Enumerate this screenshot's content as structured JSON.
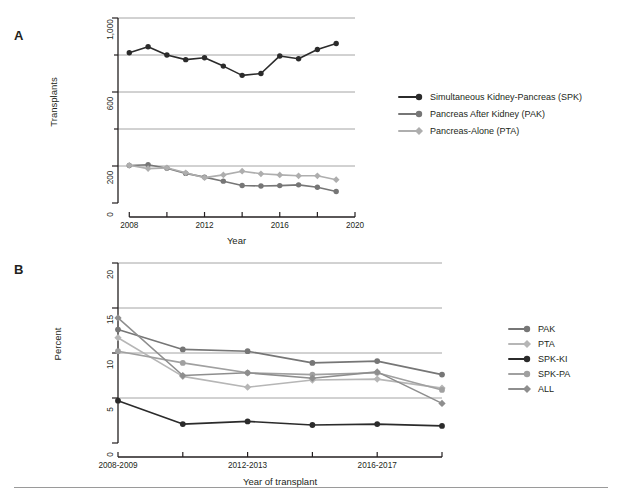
{
  "figure": {
    "panels": [
      {
        "letter": "A"
      },
      {
        "letter": "B"
      }
    ]
  },
  "chart_data": [
    {
      "type": "line",
      "panel": "A",
      "title": "",
      "xlabel": "Year",
      "ylabel": "Transplants",
      "xlim": [
        2007.4,
        2020.0
      ],
      "ylim": [
        0,
        1000
      ],
      "xticks": [
        2008,
        2010,
        2012,
        2014,
        2016,
        2018,
        2020
      ],
      "xticklabels": [
        "2008",
        "",
        "2012",
        "",
        "2016",
        "",
        "2020"
      ],
      "yticks": [
        0,
        200,
        400,
        600,
        800,
        1000
      ],
      "yticklabels": [
        "0",
        "200",
        "",
        "600",
        "",
        "1,000"
      ],
      "gridlines": [
        200,
        400,
        600,
        800,
        1000
      ],
      "grid": true,
      "legend_position": "right",
      "x": [
        2008,
        2009,
        2010,
        2011,
        2012,
        2013,
        2014,
        2015,
        2016,
        2017,
        2018,
        2019
      ],
      "series": [
        {
          "name": "Simultaneous Kidney-Pancreas (SPK)",
          "key": "SPK",
          "color": "#2b2b2b",
          "marker": "circle",
          "values": [
            812,
            845,
            800,
            775,
            785,
            740,
            690,
            700,
            795,
            780,
            830,
            862
          ]
        },
        {
          "name": "Pancreas After Kidney (PAK)",
          "key": "PAK",
          "color": "#767676",
          "marker": "circle",
          "values": [
            203,
            207,
            188,
            160,
            140,
            118,
            95,
            92,
            94,
            98,
            85,
            62
          ]
        },
        {
          "name": "Pancreas-Alone (PTA)",
          "key": "PTA",
          "color": "#aeaeae",
          "marker": "diamond",
          "values": [
            204,
            186,
            190,
            163,
            137,
            152,
            172,
            158,
            152,
            147,
            147,
            126
          ]
        }
      ]
    },
    {
      "type": "line",
      "panel": "B",
      "title": "",
      "xlabel": "Year of transplant",
      "ylabel": "Percent",
      "xlim": [
        0,
        5
      ],
      "ylim": [
        0,
        20
      ],
      "xticks": [
        0,
        1,
        2,
        3,
        4,
        5
      ],
      "xticklabels": [
        "2008-2009",
        "",
        "2012-2013",
        "",
        "2016-2017",
        ""
      ],
      "categories": [
        "2008-2009",
        "2010-2011",
        "2012-2013",
        "2014-2015",
        "2016-2017",
        "2018-2019"
      ],
      "yticks": [
        0,
        5,
        10,
        15,
        20
      ],
      "yticklabels": [
        "0",
        "5",
        "10",
        "15",
        "20"
      ],
      "gridlines": [
        5,
        10,
        15,
        20
      ],
      "grid": true,
      "legend_position": "right",
      "series": [
        {
          "name": "PAK",
          "key": "PAK",
          "color": "#767676",
          "marker": "circle",
          "values": [
            12.6,
            10.4,
            10.2,
            8.9,
            9.1,
            7.6
          ]
        },
        {
          "name": "PTA",
          "key": "PTA",
          "color": "#b6b6b6",
          "marker": "diamond",
          "values": [
            11.7,
            7.4,
            6.2,
            7.0,
            7.1,
            6.1
          ]
        },
        {
          "name": "SPK-KI",
          "key": "SPK-KI",
          "color": "#2b2b2b",
          "marker": "circle",
          "values": [
            4.7,
            2.1,
            2.4,
            2.0,
            2.1,
            1.9
          ]
        },
        {
          "name": "SPK-PA",
          "key": "SPK-PA",
          "color": "#a0a0a0",
          "marker": "circle",
          "values": [
            10.2,
            8.9,
            7.8,
            7.6,
            7.8,
            5.9
          ]
        },
        {
          "name": "ALL",
          "key": "ALL",
          "color": "#8e8e8e",
          "marker": "diamond",
          "values": [
            13.9,
            7.5,
            7.8,
            7.2,
            7.9,
            4.4
          ]
        }
      ]
    }
  ]
}
